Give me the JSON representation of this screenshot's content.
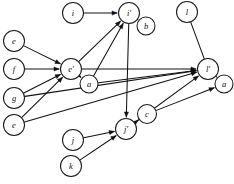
{
  "figure": {
    "type": "directed-graph",
    "width": 234,
    "height": 184,
    "background_color": "#ffffff",
    "stroke_color": "#111111",
    "node_fill_color": "#ffffff",
    "node_stroke_color": "#1a1a1a"
  },
  "nodes": [
    {
      "id": "i",
      "label": "i",
      "x": 73,
      "y": 13,
      "r": 10.5
    },
    {
      "id": "i_p",
      "label": "i′",
      "x": 129,
      "y": 13,
      "r": 10.5
    },
    {
      "id": "b",
      "label": "b",
      "x": 146,
      "y": 26,
      "r": 9.0
    },
    {
      "id": "l",
      "label": "l",
      "x": 187,
      "y": 12,
      "r": 10.5
    },
    {
      "id": "e_top",
      "label": "e",
      "x": 14,
      "y": 41,
      "r": 10.5
    },
    {
      "id": "f",
      "label": "f",
      "x": 14,
      "y": 69,
      "r": 10.5
    },
    {
      "id": "e_p",
      "label": "e′",
      "x": 71,
      "y": 69,
      "r": 10.5
    },
    {
      "id": "a_left",
      "label": "a",
      "x": 89,
      "y": 84,
      "r": 9.0
    },
    {
      "id": "l_p",
      "label": "l′",
      "x": 208,
      "y": 69,
      "r": 10.5
    },
    {
      "id": "a_right",
      "label": "a",
      "x": 224,
      "y": 84,
      "r": 9.0
    },
    {
      "id": "g",
      "label": "g",
      "x": 14,
      "y": 98,
      "r": 10.5
    },
    {
      "id": "e_bot",
      "label": "e",
      "x": 14,
      "y": 125,
      "r": 10.5
    },
    {
      "id": "c",
      "label": "c",
      "x": 147,
      "y": 114,
      "r": 9.5
    },
    {
      "id": "j_p",
      "label": "j′",
      "x": 126,
      "y": 129,
      "r": 10.5
    },
    {
      "id": "j",
      "label": "j",
      "x": 73,
      "y": 140,
      "r": 10.5
    },
    {
      "id": "k",
      "label": "k",
      "x": 71,
      "y": 166,
      "r": 10.5
    }
  ],
  "edges": [
    {
      "from": "i",
      "to": "i_p",
      "arrow": true
    },
    {
      "from": "i_p",
      "to": "b",
      "arrow": true
    },
    {
      "from": "l",
      "to": "l_p",
      "arrow": false
    },
    {
      "from": "e_top",
      "to": "e_p",
      "arrow": true
    },
    {
      "from": "f",
      "to": "e_p",
      "arrow": true
    },
    {
      "from": "g",
      "to": "e_p",
      "arrow": true
    },
    {
      "from": "e_p",
      "to": "a_left",
      "arrow": true
    },
    {
      "from": "e_p",
      "to": "i_p",
      "arrow": true
    },
    {
      "from": "a_left",
      "to": "i_p",
      "arrow": true
    },
    {
      "from": "i_p",
      "to": "j_p",
      "arrow": true
    },
    {
      "from": "e_p",
      "to": "l_p",
      "arrow": true
    },
    {
      "from": "a_left",
      "to": "l_p",
      "arrow": true
    },
    {
      "from": "l_p",
      "to": "a_right",
      "arrow": true
    },
    {
      "from": "g",
      "to": "l_p",
      "arrow": true
    },
    {
      "from": "e_bot",
      "to": "l_p",
      "arrow": true
    },
    {
      "from": "e_bot",
      "to": "e_p",
      "arrow": true
    },
    {
      "from": "j_p",
      "to": "c",
      "arrow": true
    },
    {
      "from": "j_p",
      "to": "l_p",
      "arrow": true
    },
    {
      "from": "c",
      "to": "a_right",
      "arrow": true
    },
    {
      "from": "j",
      "to": "j_p",
      "arrow": true
    },
    {
      "from": "k",
      "to": "j_p",
      "arrow": true
    }
  ]
}
